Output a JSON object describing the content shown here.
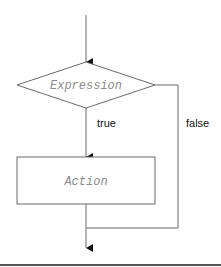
{
  "diagram": {
    "type": "flowchart",
    "nodes": {
      "decision": {
        "shape": "diamond",
        "label": "Expression"
      },
      "action": {
        "shape": "rectangle",
        "label": "Action"
      }
    },
    "edges": {
      "true_label": "true",
      "false_label": "false"
    },
    "colors": {
      "line": "#6b6b6b",
      "node_text": "#8a8a8a",
      "edge_text": "#111111",
      "arrowhead": "#111111",
      "rule": "#555555"
    }
  }
}
